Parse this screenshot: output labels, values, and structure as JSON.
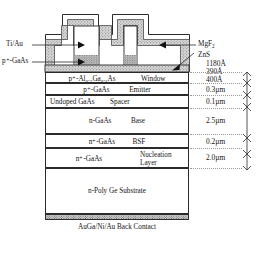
{
  "figure": {
    "left_labels": [
      {
        "id": "ti-au",
        "text": "Ti/Au"
      },
      {
        "id": "p-plus-gaas-contact",
        "text": "p⁺-GaAs"
      }
    ],
    "right_labels": [
      {
        "id": "mgf2",
        "text": "MgF",
        "sub": "2"
      },
      {
        "id": "zns",
        "text": "ZnS"
      }
    ],
    "layers": [
      {
        "id": "window",
        "material": "p⁺-Al₀.₇Ga₀.₃As",
        "role": "Window",
        "thickness": "400Å"
      },
      {
        "id": "emitter",
        "material": "p⁺-GaAs",
        "role": "Emitter",
        "thickness": "0.3µm"
      },
      {
        "id": "spacer",
        "material": "Undoped    GaAs",
        "role": "Spacer",
        "thickness": "0.1µm"
      },
      {
        "id": "base",
        "material": "n-GaAs",
        "role": "Base",
        "thickness": "2.5µm"
      },
      {
        "id": "bsf",
        "material": "n⁺-GaAs",
        "role": "BSF",
        "thickness": "0.2µm"
      },
      {
        "id": "nucleation",
        "material": "n⁺-GaAs",
        "role": "Nucleation Layer",
        "thickness": "2.0µm"
      },
      {
        "id": "substrate",
        "material": "n-Poly Ge Substrate",
        "role": "",
        "thickness": ""
      }
    ],
    "coating_thicknesses": [
      {
        "id": "mgf2-thickness",
        "text": "1180Å"
      },
      {
        "id": "zns-thickness",
        "text": "390Å"
      }
    ],
    "back_contact": {
      "text": "AuGa/Ni/Au Back Contact"
    },
    "colors": {
      "line": "#2b2b2b",
      "text": "#141414",
      "stipple_fill": "#d9d9d9",
      "light_fill": "#ededed",
      "background": "#ffffff"
    }
  }
}
